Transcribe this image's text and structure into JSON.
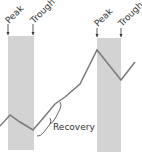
{
  "diagram": {
    "type": "business-cycle",
    "labels": {
      "peak_1": "Peak",
      "trough_1": "Trough",
      "peak_2": "Peak",
      "trough_2": "Trough",
      "recovery": "Recovery"
    },
    "colors": {
      "band": "#d3d3d3",
      "line": "#7a7a7a",
      "text": "#333333"
    }
  }
}
